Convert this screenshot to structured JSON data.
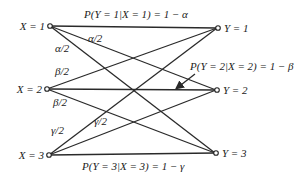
{
  "diagram": {
    "type": "discrete-channel-transition-diagram",
    "inputs": [
      {
        "label": "X = 1"
      },
      {
        "label": "X = 2"
      },
      {
        "label": "X = 3"
      }
    ],
    "outputs": [
      {
        "label": "Y = 1"
      },
      {
        "label": "Y = 2"
      },
      {
        "label": "Y = 3"
      }
    ],
    "edge_labels": {
      "x1_y1": "P(Y = 1|X = 1) = 1 − α",
      "x1_y2": "α/2",
      "x1_y3": "α/2",
      "x2_y1": "β/2",
      "x2_y2": "P(Y = 2|X = 2) = 1 − β",
      "x2_y3": "β/2",
      "x3_y1": "γ/2",
      "x3_y2": "γ/2",
      "x3_y3": "P(Y = 3|X = 3) = 1 − γ"
    }
  }
}
